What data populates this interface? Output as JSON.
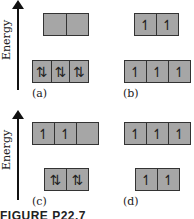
{
  "figure": {
    "caption": "FIGURE P22.7",
    "axis_label": "Energy",
    "panels": [
      {
        "id": "a",
        "label": "(a)",
        "upper": [
          "",
          ""
        ],
        "lower": [
          "⇅",
          "⇅",
          "⇅"
        ]
      },
      {
        "id": "b",
        "label": "(b)",
        "upper": [
          "↿",
          "↿"
        ],
        "lower": [
          "↿",
          "↿",
          "↿"
        ]
      },
      {
        "id": "c",
        "label": "(c)",
        "upper": [
          "↿",
          "↿",
          ""
        ],
        "lower": [
          "⇅",
          "⇅"
        ]
      },
      {
        "id": "d",
        "label": "(d)",
        "upper": [
          "↿",
          "↿",
          "↿"
        ],
        "lower": [
          "↿",
          "↿"
        ]
      }
    ],
    "colors": {
      "box_fill": "#a6a6a6",
      "border": "#333333"
    }
  }
}
